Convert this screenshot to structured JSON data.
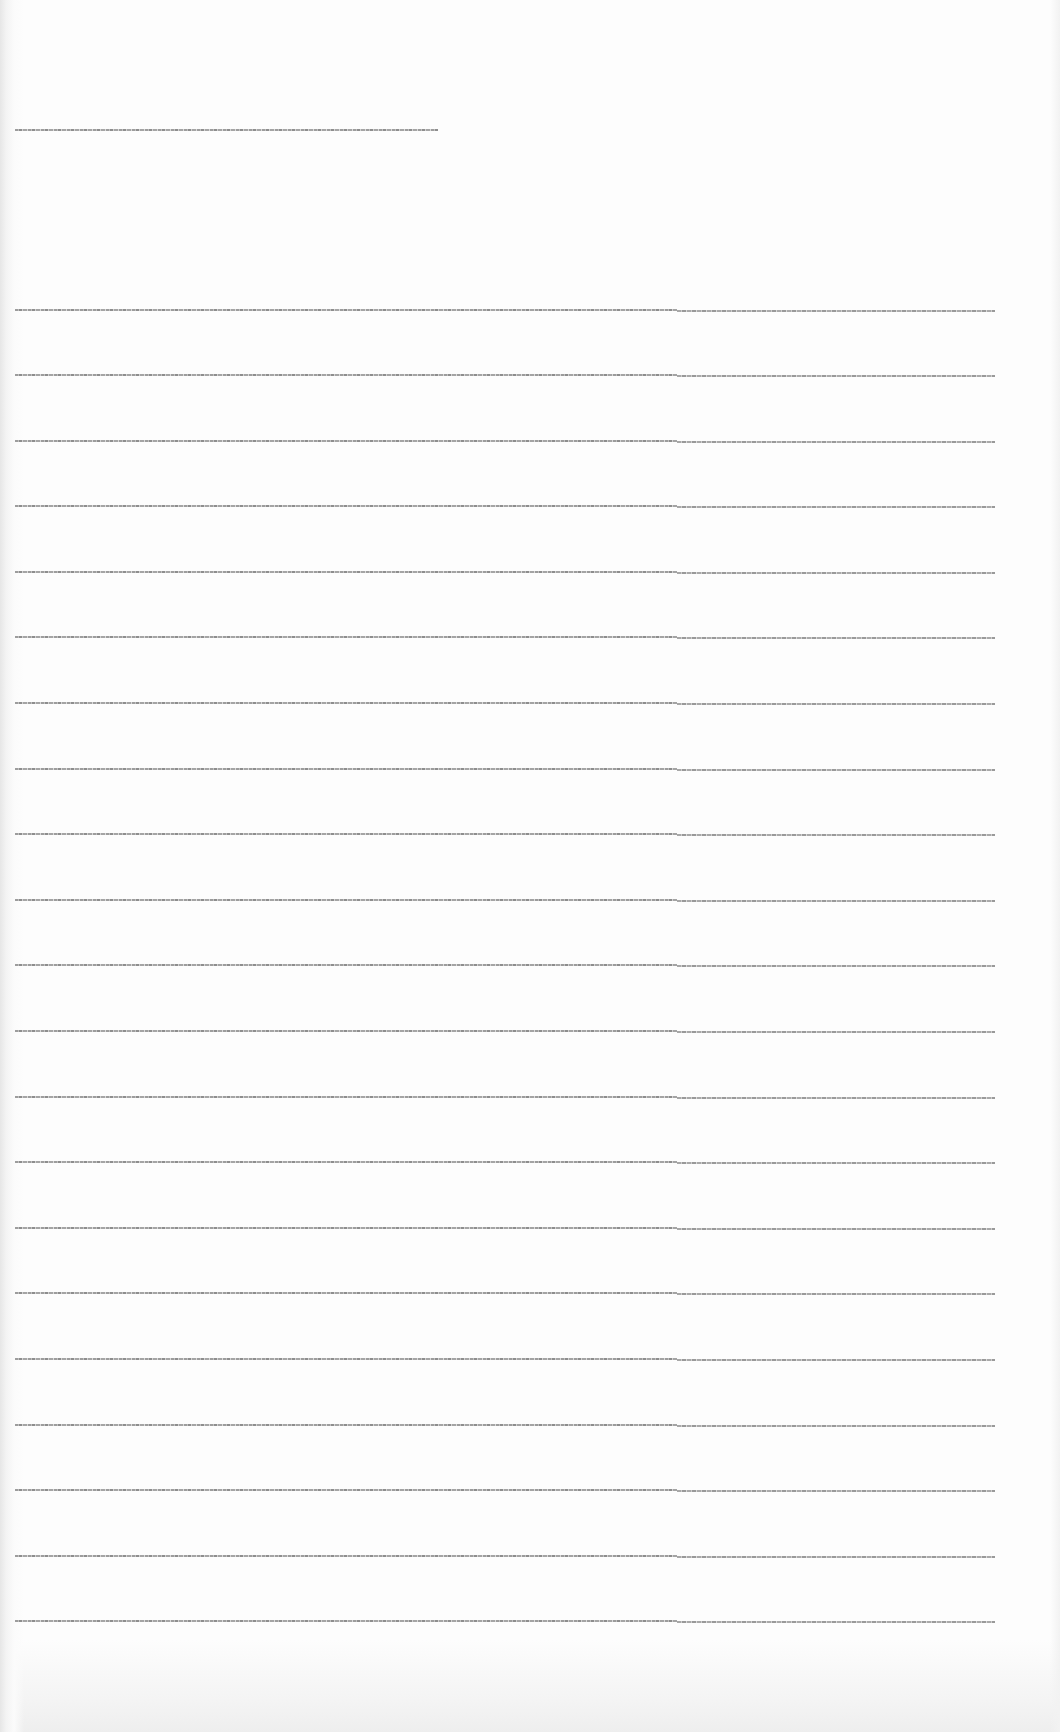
{
  "document": {
    "type": "scanned-page",
    "background_color": "#fdfdfd",
    "line_color": "#8c8c8c",
    "legibility": "illegible",
    "header_line": {
      "text": "[illegible]",
      "x": 15,
      "y": 129,
      "width": 423
    },
    "body_lines": [
      {
        "text": "[illegible]",
        "y": 309
      },
      {
        "text": "[illegible]",
        "y": 374
      },
      {
        "text": "[illegible]",
        "y": 440
      },
      {
        "text": "[illegible]",
        "y": 505
      },
      {
        "text": "[illegible]",
        "y": 571
      },
      {
        "text": "[illegible]",
        "y": 636
      },
      {
        "text": "[illegible]",
        "y": 702
      },
      {
        "text": "[illegible]",
        "y": 768
      },
      {
        "text": "[illegible]",
        "y": 833
      },
      {
        "text": "[illegible]",
        "y": 899
      },
      {
        "text": "[illegible]",
        "y": 964
      },
      {
        "text": "[illegible]",
        "y": 1030
      },
      {
        "text": "[illegible]",
        "y": 1096
      },
      {
        "text": "[illegible]",
        "y": 1161
      },
      {
        "text": "[illegible]",
        "y": 1227
      },
      {
        "text": "[illegible]",
        "y": 1292
      },
      {
        "text": "[illegible]",
        "y": 1358
      },
      {
        "text": "[illegible]",
        "y": 1424
      },
      {
        "text": "[illegible]",
        "y": 1489
      },
      {
        "text": "[illegible]",
        "y": 1555
      },
      {
        "text": "[illegible]",
        "y": 1620
      }
    ],
    "body_line_x": 15,
    "body_line_width": 980,
    "body_line_step_x": 677
  }
}
